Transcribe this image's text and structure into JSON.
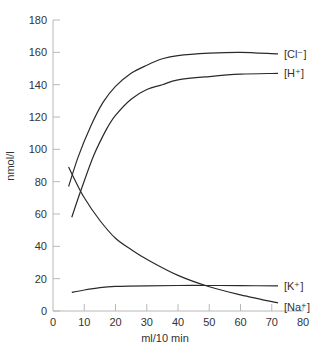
{
  "chart_data": {
    "type": "line",
    "title": "",
    "xlabel": "ml/10 min",
    "ylabel": "nmol/l",
    "xlim": [
      0,
      80
    ],
    "ylim": [
      0,
      180
    ],
    "xticks": [
      0,
      10,
      20,
      30,
      40,
      50,
      60,
      70,
      80
    ],
    "yticks": [
      0,
      20,
      40,
      60,
      80,
      100,
      120,
      140,
      160,
      180
    ],
    "grid": false,
    "legend": "inline labels at right end of each curve",
    "series": [
      {
        "name": "[Cl⁻]",
        "x": [
          5,
          8,
          12,
          16,
          20,
          25,
          30,
          35,
          40,
          50,
          60,
          72
        ],
        "values": [
          77,
          95,
          114,
          129,
          139,
          147,
          152,
          156,
          158,
          159.5,
          160,
          159
        ]
      },
      {
        "name": "[H⁺]",
        "x": [
          6,
          9,
          13,
          17,
          20,
          25,
          30,
          35,
          40,
          50,
          60,
          72
        ],
        "values": [
          58,
          75,
          96,
          112,
          121,
          131,
          137,
          140,
          143,
          145,
          146.5,
          147
        ]
      },
      {
        "name": "[K⁺]",
        "x": [
          6,
          10,
          15,
          20,
          30,
          40,
          50,
          60,
          72
        ],
        "values": [
          11.5,
          13,
          14.5,
          15.2,
          15.6,
          15.8,
          15.8,
          15.7,
          15.5
        ]
      },
      {
        "name": "[Na⁺]",
        "x": [
          5,
          7,
          10,
          15,
          20,
          25,
          30,
          40,
          50,
          60,
          72
        ],
        "values": [
          89,
          81,
          70,
          56,
          45,
          38,
          32,
          22,
          15,
          10,
          5
        ]
      }
    ]
  },
  "labels": {
    "xlabel": "ml/10 min",
    "ylabel": "nmol/l"
  }
}
